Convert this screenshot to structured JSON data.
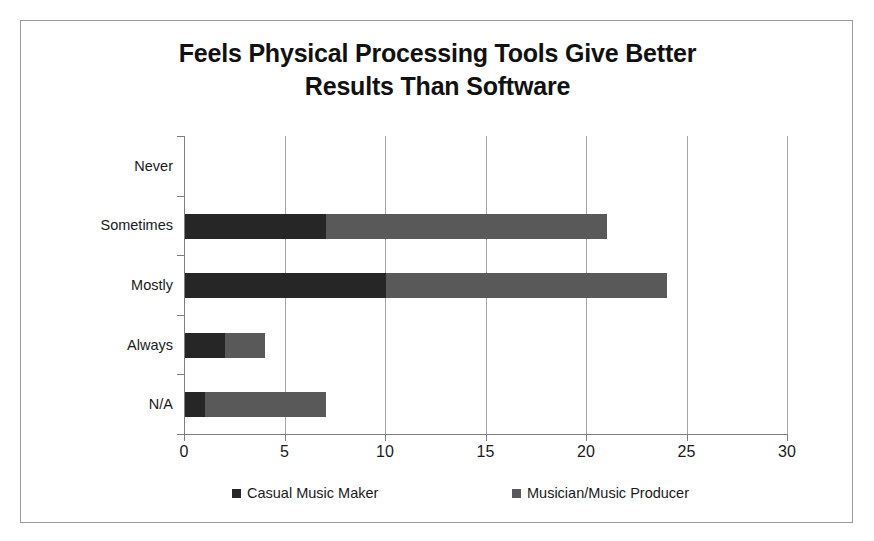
{
  "chart_data": {
    "type": "bar",
    "orientation": "horizontal",
    "stacked": true,
    "title": "Feels Physical Processing Tools Give Better Results Than Software",
    "title_lines": [
      "Feels Physical Processing Tools Give Better",
      "Results Than Software"
    ],
    "xlabel": "",
    "ylabel": "",
    "categories": [
      "Never",
      "Sometimes",
      "Mostly",
      "Always",
      "N/A"
    ],
    "series": [
      {
        "name": "Casual Music Maker",
        "color": "#262626",
        "values": [
          0,
          7,
          10,
          2,
          1
        ]
      },
      {
        "name": "Musician/Music Producer",
        "color": "#595959",
        "values": [
          0,
          14,
          14,
          2,
          6
        ]
      }
    ],
    "totals": [
      0,
      21,
      24,
      4,
      7
    ],
    "xlim": [
      0,
      30
    ],
    "xticks": [
      0,
      5,
      10,
      15,
      20,
      25,
      30
    ],
    "xtick_labels": [
      "0",
      "5",
      "10",
      "15",
      "20",
      "25",
      "30"
    ],
    "grid": "vertical",
    "legend_position": "bottom",
    "legend": [
      {
        "label": "Casual Music Maker",
        "swatch": "#262626"
      },
      {
        "label": "Musician/Music Producer",
        "swatch": "#595959"
      }
    ],
    "frame_border_color": "#9a9a9a",
    "axis_color": "#7f7f7f",
    "gridline_color": "#a6a6a6"
  }
}
